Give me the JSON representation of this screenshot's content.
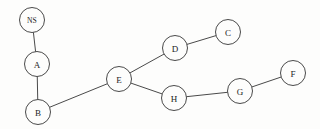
{
  "diagram": {
    "type": "node-link-graph",
    "width": 320,
    "height": 129,
    "background_color": "#fdfdfc",
    "node_fill_color": "#fdfdfc",
    "node_stroke_color": "#4a4a4a",
    "edge_color": "#4a4a4a",
    "label_color": "#1c1c1c",
    "node_radius": 12.5,
    "nodes": [
      {
        "id": "NS",
        "label": "NS",
        "x": 32,
        "y": 20,
        "r": 12.5
      },
      {
        "id": "A",
        "label": "A",
        "x": 37,
        "y": 64,
        "r": 12.5
      },
      {
        "id": "B",
        "label": "B",
        "x": 38,
        "y": 112,
        "r": 12.5
      },
      {
        "id": "E",
        "label": "E",
        "x": 119,
        "y": 79,
        "r": 12.5
      },
      {
        "id": "D",
        "label": "D",
        "x": 175,
        "y": 48,
        "r": 12.5
      },
      {
        "id": "C",
        "label": "C",
        "x": 228,
        "y": 32,
        "r": 12.5
      },
      {
        "id": "H",
        "label": "H",
        "x": 174,
        "y": 98,
        "r": 12.5
      },
      {
        "id": "G",
        "label": "G",
        "x": 240,
        "y": 91,
        "r": 12.5
      },
      {
        "id": "F",
        "label": "F",
        "x": 293,
        "y": 73,
        "r": 12.5
      }
    ],
    "edges": [
      {
        "from": "NS",
        "to": "A"
      },
      {
        "from": "A",
        "to": "B"
      },
      {
        "from": "B",
        "to": "E"
      },
      {
        "from": "E",
        "to": "D"
      },
      {
        "from": "E",
        "to": "H"
      },
      {
        "from": "D",
        "to": "C"
      },
      {
        "from": "H",
        "to": "G"
      },
      {
        "from": "G",
        "to": "F"
      }
    ]
  }
}
